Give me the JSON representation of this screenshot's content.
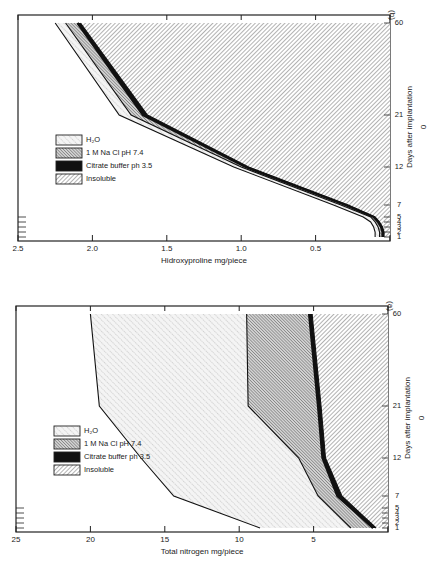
{
  "figure": {
    "colors": {
      "ink": "#222222",
      "paper": "#ffffff",
      "fill_light": "#f1f1f1",
      "fill_mid": "#c8c8c8"
    },
    "legend_entries": [
      "H₂O",
      "1 M Na Cl pH 7.4",
      "Citrate buffer ph 3.5",
      "Insoluble"
    ]
  },
  "chart_data": [
    {
      "id": "a",
      "type": "area",
      "stacked": true,
      "panel_label": "(a)",
      "title": "",
      "xlabel": "Days after implantation",
      "ylabel": "Total nitrogen mg/piece",
      "x_ticks": [
        1,
        2,
        3,
        4,
        5,
        7,
        12,
        21,
        60
      ],
      "x_tick_labels": [
        "1",
        "2",
        "3",
        "4",
        "5",
        "7",
        "12",
        "21",
        "60"
      ],
      "y_ticks": [
        0,
        5,
        10,
        15,
        20,
        25
      ],
      "y_tick_labels": [
        "0",
        "5",
        "10",
        "15",
        "20",
        "25"
      ],
      "ylim": [
        0,
        25
      ],
      "x_scale": "categorical-uneven",
      "legend_position": "top-left",
      "x": [
        1,
        7,
        12,
        21,
        60
      ],
      "series_cumulative_top": [
        {
          "name": "H₂O",
          "pattern": "dotted-hatch",
          "values": [
            8.6,
            14.4,
            16.6,
            19.4,
            20.0
          ]
        },
        {
          "name": "1 M Na Cl pH 7.4",
          "pattern": "dense-hatch",
          "values": [
            2.5,
            4.7,
            6.0,
            9.4,
            9.5
          ]
        },
        {
          "name": "Citrate buffer ph 3.5",
          "pattern": "solid-black",
          "values": [
            1.0,
            3.4,
            4.4,
            4.7,
            5.3
          ]
        },
        {
          "name": "Insoluble",
          "pattern": "diagonal-hatch",
          "values": [
            0.8,
            3.1,
            4.2,
            4.5,
            5.1
          ]
        }
      ]
    },
    {
      "id": "b",
      "type": "area",
      "stacked": true,
      "panel_label": "(b)",
      "title": "",
      "xlabel": "Days after implantation",
      "ylabel": "Hidroxyproline mg/piece",
      "x_ticks": [
        1,
        2,
        3,
        4,
        5,
        7,
        12,
        21,
        60
      ],
      "x_tick_labels": [
        "1",
        "2",
        "3",
        "4",
        "5",
        "7",
        "12",
        "21",
        "60"
      ],
      "y_ticks": [
        0,
        0.5,
        1.0,
        1.5,
        2.0,
        2.5
      ],
      "y_tick_labels": [
        "0",
        "0.5",
        "1.0",
        "1.5",
        "2.0",
        "2.5"
      ],
      "ylim": [
        0,
        2.5
      ],
      "x_scale": "categorical-uneven",
      "legend_position": "top-left",
      "x": [
        1,
        2,
        3,
        4,
        5,
        7,
        12,
        21,
        60
      ],
      "series_cumulative_top": [
        {
          "name": "H₂O",
          "pattern": "dotted-hatch",
          "values": [
            0.1,
            0.1,
            0.11,
            0.13,
            0.18,
            0.38,
            1.05,
            1.82,
            2.25
          ]
        },
        {
          "name": "1 M Na Cl pH 7.4",
          "pattern": "dense-hatch",
          "values": [
            0.07,
            0.07,
            0.08,
            0.1,
            0.13,
            0.33,
            1.0,
            1.74,
            2.18
          ]
        },
        {
          "name": "Citrate buffer ph 3.5",
          "pattern": "solid-black",
          "values": [
            0.05,
            0.05,
            0.06,
            0.08,
            0.11,
            0.3,
            0.97,
            1.66,
            2.1
          ]
        },
        {
          "name": "Insoluble",
          "pattern": "diagonal-hatch",
          "values": [
            0.04,
            0.04,
            0.05,
            0.07,
            0.1,
            0.28,
            0.95,
            1.63,
            2.08
          ]
        }
      ]
    }
  ]
}
